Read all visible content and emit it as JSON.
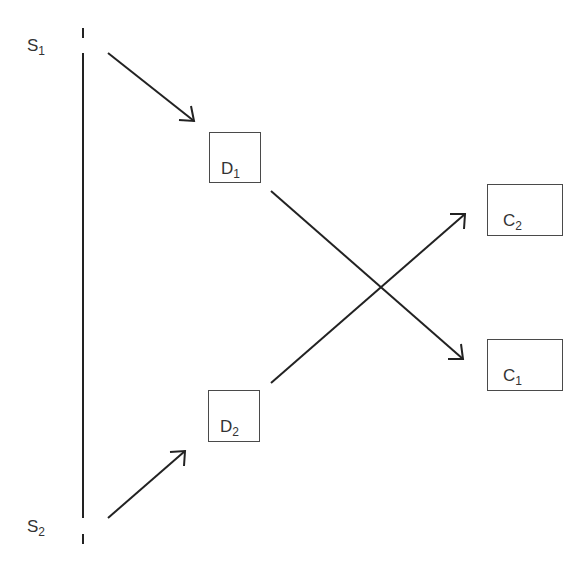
{
  "diagram": {
    "type": "flow",
    "timeline": {
      "name": "vertical timeline axis",
      "top_label": {
        "base": "S",
        "sub": "1"
      },
      "bottom_label": {
        "base": "S",
        "sub": "2"
      }
    },
    "nodes": [
      {
        "id": "D1",
        "base": "D",
        "sub": "1"
      },
      {
        "id": "D2",
        "base": "D",
        "sub": "2"
      },
      {
        "id": "C1",
        "base": "C",
        "sub": "1"
      },
      {
        "id": "C2",
        "base": "C",
        "sub": "2"
      }
    ],
    "edges": [
      {
        "from": "S1",
        "to": "D1"
      },
      {
        "from": "S2",
        "to": "D2"
      },
      {
        "from": "D1",
        "to": "C1"
      },
      {
        "from": "D2",
        "to": "C2"
      }
    ],
    "colors": {
      "line": "#222222",
      "box_border": "#4a4a4a",
      "text": "#333333",
      "background": "#ffffff"
    }
  }
}
